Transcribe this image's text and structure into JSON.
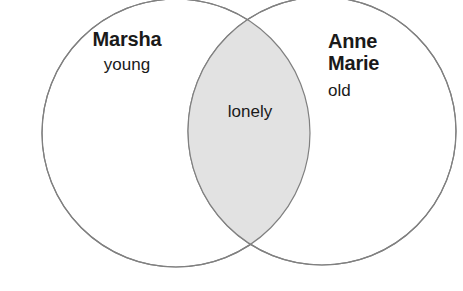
{
  "diagram": {
    "type": "venn",
    "title": "",
    "background_color": "#ffffff",
    "stroke_color": "#808080",
    "intersection_fill": "#e2e2e2",
    "circle_fill": "#ffffff",
    "text_color": "#1a1a1a",
    "left_set": {
      "name": "Marsha",
      "attribute": "young"
    },
    "right_set": {
      "name_line1": "Anne",
      "name_line2": "Marie",
      "attribute": "old"
    },
    "intersection": {
      "attribute": "lonely"
    }
  }
}
